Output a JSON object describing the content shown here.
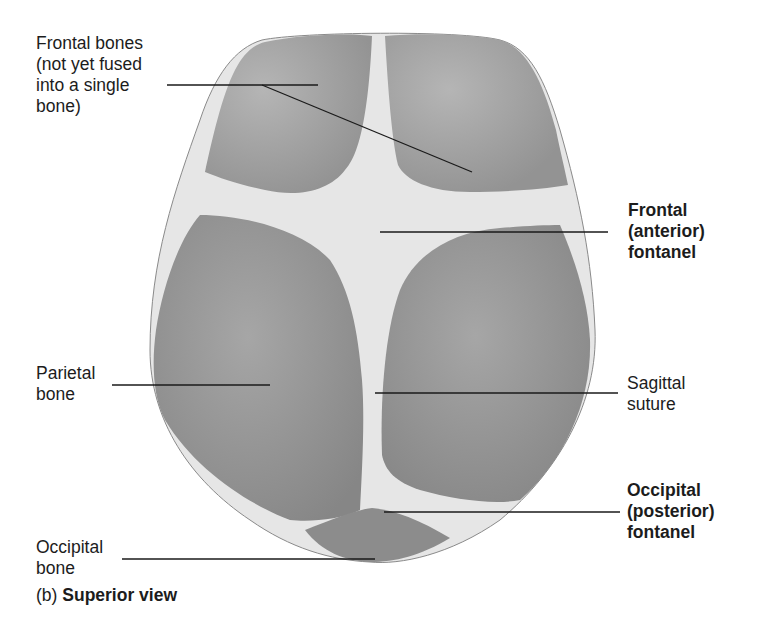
{
  "figure": {
    "caption": {
      "prefix": "(b)",
      "title": "Superior view"
    },
    "labels": {
      "frontal_bones": "Frontal bones\n(not yet fused\ninto a single\nbone)",
      "frontal_fontanel": "Frontal\n(anterior)\nfontanel",
      "parietal_bone": "Parietal\nbone",
      "sagittal_suture": "Sagittal\nsuture",
      "occipital_fontanel": "Occipital\n(posterior)\nfontanel",
      "occipital_bone": "Occipital\nbone"
    },
    "colors": {
      "bone": "#9a9a9a",
      "bone_dark": "#7f7f7f",
      "membrane": "#e8e8e8",
      "leader": "#1a1a1a",
      "background": "#ffffff"
    }
  }
}
